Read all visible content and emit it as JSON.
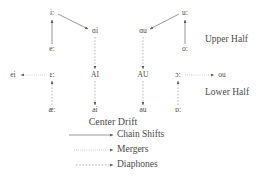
{
  "diagram": {
    "title": "Center Drift",
    "nodes": [
      {
        "id": "i-long",
        "label": "iː",
        "x": 52,
        "y": 13
      },
      {
        "id": "e-long",
        "label": "eː",
        "x": 52,
        "y": 49
      },
      {
        "id": "ai-ipa",
        "label": "ɑi",
        "x": 95,
        "y": 31
      },
      {
        "id": "AI",
        "label": "AI",
        "x": 95,
        "y": 75
      },
      {
        "id": "ai-low",
        "label": "ai",
        "x": 95,
        "y": 110
      },
      {
        "id": "au-ipa",
        "label": "ɑu",
        "x": 143,
        "y": 31
      },
      {
        "id": "AU",
        "label": "AU",
        "x": 143,
        "y": 75
      },
      {
        "id": "au-low",
        "label": "au",
        "x": 143,
        "y": 110
      },
      {
        "id": "u-long",
        "label": "uː",
        "x": 185,
        "y": 13
      },
      {
        "id": "o-long",
        "label": "oː",
        "x": 185,
        "y": 49
      },
      {
        "id": "open-o",
        "label": "ɔː",
        "x": 178,
        "y": 75
      },
      {
        "id": "a-long",
        "label": "ɒː",
        "x": 178,
        "y": 110
      },
      {
        "id": "ou",
        "label": "ou",
        "x": 222,
        "y": 75
      },
      {
        "id": "ei",
        "label": "ei",
        "x": 13,
        "y": 75
      },
      {
        "id": "ee-long",
        "label": "ɛː",
        "x": 52,
        "y": 75
      },
      {
        "id": "ae-low",
        "label": "æː",
        "x": 52,
        "y": 110
      }
    ],
    "half_labels": [
      {
        "id": "upper-half",
        "label": "Upper Half",
        "x": 205,
        "y": 40
      },
      {
        "id": "lower-half",
        "label": "Lower Half",
        "x": 205,
        "y": 93
      }
    ],
    "legend": [
      {
        "id": "chain-shifts",
        "label": "Chain Shifts",
        "style": "solid"
      },
      {
        "id": "mergers",
        "label": "Mergers",
        "style": "dotted"
      },
      {
        "id": "diaphones",
        "label": "Diaphones",
        "style": "dashed"
      }
    ],
    "colors": {
      "stroke": "#6b6b6b",
      "text": "#4a4a4a",
      "background": "#ffffff"
    }
  }
}
